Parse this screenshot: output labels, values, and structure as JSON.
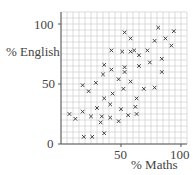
{
  "chart_data": {
    "type": "scatter",
    "title": "",
    "xlabel": "% Maths",
    "ylabel": "% English",
    "xlim": [
      0,
      100
    ],
    "ylim": [
      0,
      100
    ],
    "x_ticks": [
      "50",
      "100"
    ],
    "y_ticks": [
      "0",
      "50",
      "100"
    ],
    "grid": true,
    "legend": null,
    "marker": "x",
    "points": [
      [
        7,
        25
      ],
      [
        12,
        21
      ],
      [
        18,
        49
      ],
      [
        18,
        27
      ],
      [
        19,
        6
      ],
      [
        23,
        44
      ],
      [
        25,
        23
      ],
      [
        26,
        6
      ],
      [
        29,
        51
      ],
      [
        30,
        30
      ],
      [
        33,
        18
      ],
      [
        34,
        23
      ],
      [
        35,
        58
      ],
      [
        36,
        66
      ],
      [
        36,
        38
      ],
      [
        36,
        9
      ],
      [
        41,
        33
      ],
      [
        41,
        22
      ],
      [
        42,
        78
      ],
      [
        42,
        62
      ],
      [
        43,
        42
      ],
      [
        48,
        54
      ],
      [
        48,
        19
      ],
      [
        50,
        29
      ],
      [
        51,
        77
      ],
      [
        52,
        46
      ],
      [
        53,
        93
      ],
      [
        53,
        64
      ],
      [
        53,
        60
      ],
      [
        56,
        24
      ],
      [
        58,
        52
      ],
      [
        58,
        88
      ],
      [
        58,
        77
      ],
      [
        61,
        78
      ],
      [
        62,
        31
      ],
      [
        63,
        38
      ],
      [
        63,
        25
      ],
      [
        65,
        74
      ],
      [
        65,
        65
      ],
      [
        69,
        46
      ],
      [
        72,
        78
      ],
      [
        74,
        68
      ],
      [
        78,
        86
      ],
      [
        78,
        47
      ],
      [
        81,
        97
      ],
      [
        84,
        60
      ],
      [
        84,
        71
      ],
      [
        87,
        88
      ],
      [
        92,
        82
      ],
      [
        94,
        94
      ]
    ]
  }
}
